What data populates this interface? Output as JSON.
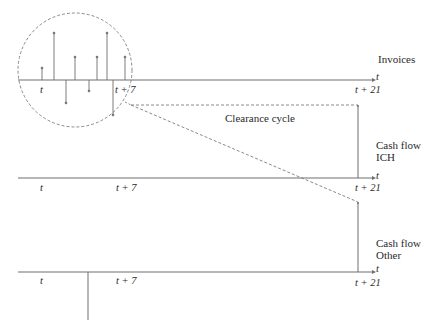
{
  "diagram": {
    "rows": [
      {
        "label": "Invoices",
        "axis_var": "t",
        "ticks": [
          "t",
          "t + 7",
          "t + 21"
        ]
      },
      {
        "label_line1": "Cash flow",
        "label_line2": "ICH",
        "axis_var": "t",
        "ticks": [
          "t",
          "t + 7",
          "t + 21"
        ]
      },
      {
        "label_line1": "Cash flow",
        "label_line2": "Other",
        "axis_var": "t",
        "ticks": [
          "t",
          "t + 7",
          "t + 21"
        ]
      }
    ],
    "annotation": "Clearance cycle",
    "invoice_stems": [
      {
        "x": 42,
        "dir": "up",
        "size": "small"
      },
      {
        "x": 54,
        "dir": "up",
        "size": "large"
      },
      {
        "x": 66,
        "dir": "down",
        "size": "medium"
      },
      {
        "x": 75,
        "dir": "up",
        "size": "medium"
      },
      {
        "x": 89,
        "dir": "down",
        "size": "small"
      },
      {
        "x": 97,
        "dir": "up",
        "size": "medium"
      },
      {
        "x": 107,
        "dir": "up",
        "size": "large"
      },
      {
        "x": 113,
        "dir": "down",
        "size": "large"
      },
      {
        "x": 125,
        "dir": "up",
        "size": "medium"
      }
    ],
    "colors": {
      "line": "#6e6e6e",
      "dashed": "#8a8a8a",
      "text": "#2a2a2a"
    }
  }
}
